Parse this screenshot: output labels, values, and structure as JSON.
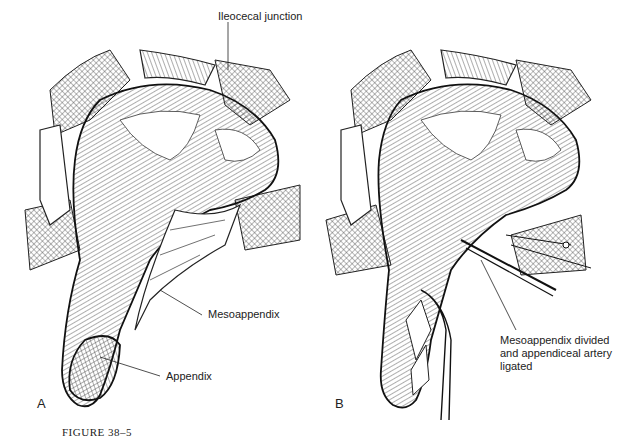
{
  "figure": {
    "caption": "FIGURE 38–5",
    "panels": [
      {
        "letter": "A",
        "labels": {
          "ileocecal_junction": "Ileocecal junction",
          "mesoappendix": "Mesoappendix",
          "appendix": "Appendix"
        }
      },
      {
        "letter": "B",
        "labels": {
          "divided": "Mesoappendix divided\nand appendiceal artery\nligated"
        }
      }
    ]
  },
  "colors": {
    "ink": "#1a1a1a",
    "background": "#ffffff"
  }
}
